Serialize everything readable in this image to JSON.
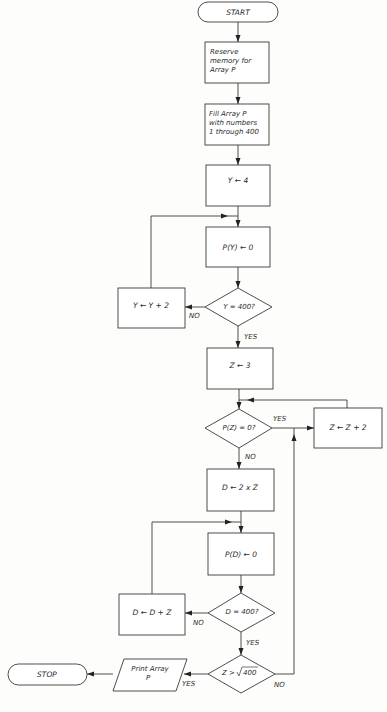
{
  "diagram": {
    "type": "flowchart",
    "nodes": {
      "start": {
        "shape": "terminal",
        "label": "START"
      },
      "reserve": {
        "shape": "process",
        "lines": [
          "Reserve",
          "memory for",
          "Array P"
        ]
      },
      "fill": {
        "shape": "process",
        "lines": [
          "Fill Array P",
          "with numbers",
          "1 through 400"
        ]
      },
      "y_init": {
        "shape": "process",
        "label": "Y ← 4"
      },
      "py_zero": {
        "shape": "process",
        "label": "P(Y) ← 0"
      },
      "y_check": {
        "shape": "decision",
        "label": "Y = 400?"
      },
      "y_inc": {
        "shape": "process",
        "label": "Y ← Y + 2"
      },
      "z_init": {
        "shape": "process",
        "label": "Z ← 3"
      },
      "pz_check": {
        "shape": "decision",
        "label": "P(Z) = 0?"
      },
      "z_inc": {
        "shape": "process",
        "label": "Z ← Z + 2"
      },
      "d_init": {
        "shape": "process",
        "label": "D ← 2 x Z"
      },
      "pd_zero": {
        "shape": "process",
        "label": "P(D) ← 0"
      },
      "d_check": {
        "shape": "decision",
        "label": "D = 400?"
      },
      "d_inc": {
        "shape": "process",
        "label": "D ← D + Z"
      },
      "z_sqrt_check": {
        "shape": "decision",
        "label_prefix": "Z >",
        "label_radicand": "400"
      },
      "print": {
        "shape": "input-output",
        "lines": [
          "Print Array",
          "P"
        ]
      },
      "stop": {
        "shape": "terminal",
        "label": "STOP"
      }
    },
    "branch_labels": {
      "y_check_no": "NO",
      "y_check_yes": "YES",
      "pz_check_yes": "YES",
      "pz_check_no": "NO",
      "d_check_no": "NO",
      "d_check_yes": "YES",
      "z_sqrt_check_yes": "YES",
      "z_sqrt_check_no": "NO"
    },
    "edges": [
      {
        "from": "start",
        "to": "reserve"
      },
      {
        "from": "reserve",
        "to": "fill"
      },
      {
        "from": "fill",
        "to": "y_init"
      },
      {
        "from": "y_init",
        "to": "py_zero"
      },
      {
        "from": "py_zero",
        "to": "y_check"
      },
      {
        "from": "y_check",
        "to": "y_inc",
        "label": "NO"
      },
      {
        "from": "y_inc",
        "to": "py_zero"
      },
      {
        "from": "y_check",
        "to": "z_init",
        "label": "YES"
      },
      {
        "from": "z_init",
        "to": "pz_check"
      },
      {
        "from": "pz_check",
        "to": "z_inc",
        "label": "YES"
      },
      {
        "from": "z_inc",
        "to": "pz_check"
      },
      {
        "from": "pz_check",
        "to": "d_init",
        "label": "NO"
      },
      {
        "from": "d_init",
        "to": "pd_zero"
      },
      {
        "from": "pd_zero",
        "to": "d_check"
      },
      {
        "from": "d_check",
        "to": "d_inc",
        "label": "NO"
      },
      {
        "from": "d_inc",
        "to": "pd_zero"
      },
      {
        "from": "d_check",
        "to": "z_sqrt_check",
        "label": "YES"
      },
      {
        "from": "z_sqrt_check",
        "to": "print",
        "label": "YES"
      },
      {
        "from": "z_sqrt_check",
        "to": "z_inc",
        "label": "NO"
      },
      {
        "from": "print",
        "to": "stop"
      }
    ],
    "colors": {
      "stroke": "#3a3a3a",
      "background": "#fdfdfb",
      "text": "#2a2a2a"
    }
  }
}
